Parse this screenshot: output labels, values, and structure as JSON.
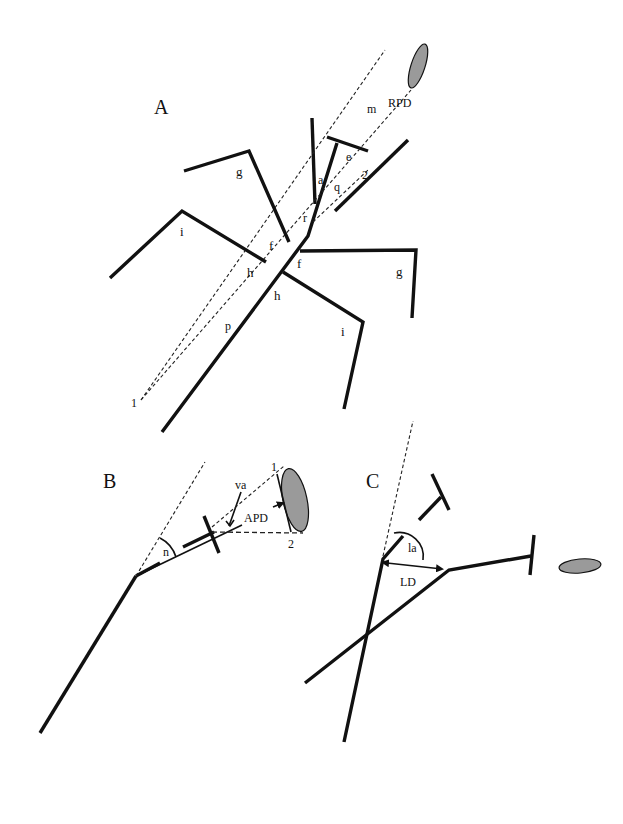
{
  "figure": {
    "panels": [
      {
        "id": "A",
        "label": "A",
        "labels": {
          "m": "m",
          "rpd": "RPD",
          "e": "e",
          "a": "a",
          "q": "q",
          "two": "2",
          "r": "r",
          "g_left": "g",
          "g_right": "g",
          "i_left": "i",
          "i_right": "i",
          "f_left": "f",
          "f_right": "f",
          "h_left": "h",
          "h_right": "h",
          "p": "p",
          "one": "1"
        }
      },
      {
        "id": "B",
        "label": "B",
        "labels": {
          "n": "n",
          "va": "va",
          "apd": "APD",
          "one": "1",
          "two": "2"
        }
      },
      {
        "id": "C",
        "label": "C",
        "labels": {
          "la": "la",
          "ld": "LD"
        }
      }
    ],
    "colors": {
      "line": "#111111",
      "target_fill": "#9a9a9a",
      "background": "#ffffff"
    }
  }
}
